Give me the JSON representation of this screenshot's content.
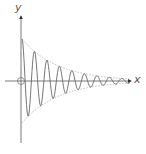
{
  "diagram": {
    "axes": {
      "x_label": "x",
      "y_label": "y"
    },
    "colors": {
      "axis": "#444444",
      "curve": "#666666",
      "envelope": "#aaaaaa",
      "origin": "#777777"
    },
    "origin_marker": "circle",
    "curve": "damped sinusoid within exponential envelope"
  }
}
